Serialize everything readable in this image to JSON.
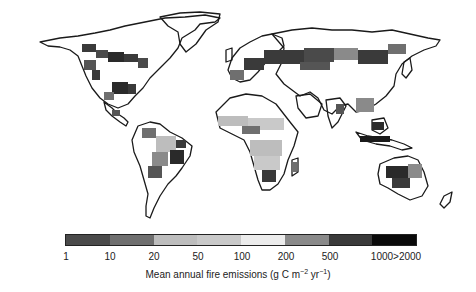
{
  "figure": {
    "type": "choropleth-map",
    "subject": "Mean annual fire emissions"
  },
  "legend": {
    "title_main": "Mean annual fire emissions (g C m",
    "title_exp1": "−2",
    "title_mid": " yr",
    "title_exp2": "−1",
    "title_end": ")",
    "ticks": [
      "1",
      "10",
      "20",
      "50",
      "100",
      "200",
      "500",
      "1000>2000"
    ],
    "tick_positions_px": [
      66,
      110,
      154,
      198,
      242,
      286,
      330,
      396
    ],
    "bins": [
      {
        "range": "1–10",
        "color": "#4a4a4a"
      },
      {
        "range": "10–20",
        "color": "#6f6f6f"
      },
      {
        "range": "20–50",
        "color": "#bdbdbd"
      },
      {
        "range": "50–100",
        "color": "#c9c9c9"
      },
      {
        "range": "100–200",
        "color": "#ececec"
      },
      {
        "range": "200–500",
        "color": "#8a8a8a"
      },
      {
        "range": "500–1000",
        "color": "#3a3a3a"
      },
      {
        "range": "1000–>2000",
        "color": "#0a0a0a"
      }
    ]
  },
  "colors": {
    "coastline": "#1a1a1a",
    "land": "#ffffff",
    "ocean": "#ffffff"
  },
  "regions": {
    "boreal_north_america": "high (dark) emissions across Canada and Alaska",
    "eastern_usa": "dark patches",
    "south_america": "light-to-dark, heavy in Brazil/Cerrado",
    "africa": "light gray savanna band north and south of equator",
    "boreal_eurasia": "dark band across Siberia",
    "southeast_asia": "dark in Indonesia, medium in Indochina",
    "australia": "dark in north and interior"
  }
}
